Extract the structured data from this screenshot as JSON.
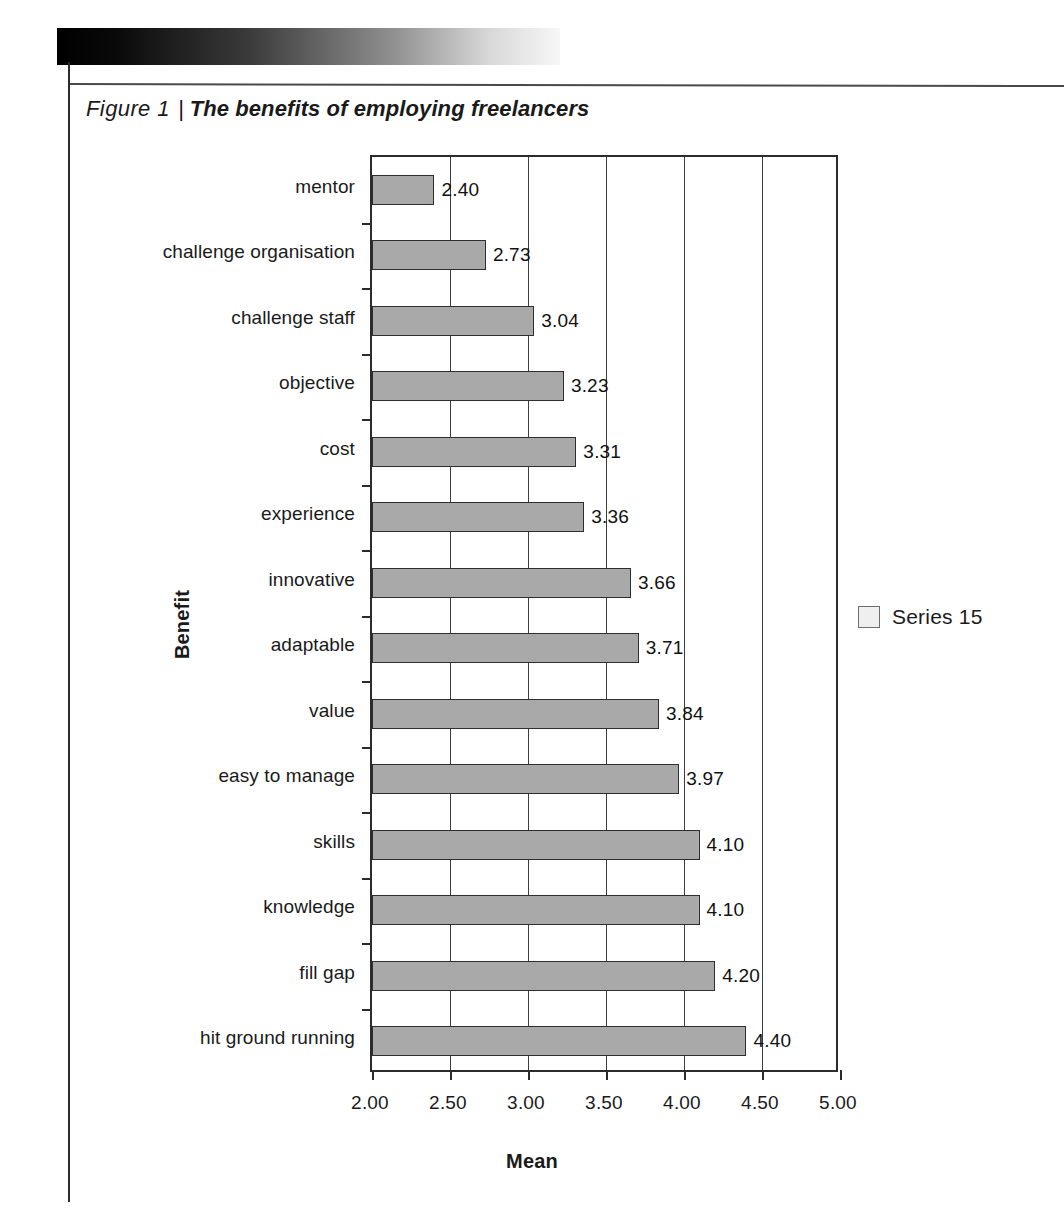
{
  "page": {
    "caption_label": "Figure 1",
    "caption_separator": "|",
    "caption_title": "The benefits of employing freelancers"
  },
  "legend": {
    "position": "right",
    "entries": [
      {
        "label": "Series 15",
        "color": "#a9a9a9"
      }
    ]
  },
  "chart_data": {
    "type": "bar",
    "orientation": "horizontal",
    "title": "The benefits of employing freelancers",
    "xlabel": "Mean",
    "ylabel": "Benefit",
    "xlim": [
      2.0,
      5.0
    ],
    "xticks": [
      "2.00",
      "2.50",
      "3.00",
      "3.50",
      "4.00",
      "4.50",
      "5.00"
    ],
    "xtick_values": [
      2.0,
      2.5,
      3.0,
      3.5,
      4.0,
      4.5,
      5.0
    ],
    "grid": "vertical",
    "legend_position": "right",
    "series": [
      {
        "name": "Series 15",
        "color": "#a9a9a9",
        "values": [
          2.4,
          2.73,
          3.04,
          3.23,
          3.31,
          3.36,
          3.66,
          3.71,
          3.84,
          3.97,
          4.1,
          4.1,
          4.2,
          4.4
        ]
      }
    ],
    "categories": [
      "mentor",
      "challenge organisation",
      "challenge staff",
      "objective",
      "cost",
      "experience",
      "innovative",
      "adaptable",
      "value",
      "easy to manage",
      "skills",
      "knowledge",
      "fill gap",
      "hit ground running"
    ],
    "data_labels": [
      "2.40",
      "2.73",
      "3.04",
      "3.23",
      "3.31",
      "3.36",
      "3.66",
      "3.71",
      "3.84",
      "3.97",
      "4.10",
      "4.10",
      "4.20",
      "4.40"
    ]
  }
}
